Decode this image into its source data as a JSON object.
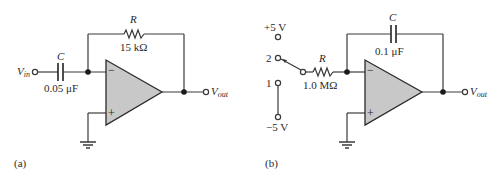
{
  "circuits": [
    {
      "id": "a",
      "caption": "(a)",
      "input_label": "V",
      "input_sub": "in",
      "output_label": "V",
      "output_sub": "out",
      "capacitor": {
        "name": "C",
        "value": "0.05 μF"
      },
      "resistor": {
        "name": "R",
        "value": "15 kΩ"
      },
      "opamp": {
        "inverting": "−",
        "noninverting": "+"
      }
    },
    {
      "id": "b",
      "caption": "(b)",
      "output_label": "V",
      "output_sub": "out",
      "switch": {
        "pos2_label": "2",
        "pos1_label": "1",
        "top_supply": "+5 V",
        "bottom_supply": "−5 V"
      },
      "resistor": {
        "name": "R",
        "value": "1.0 MΩ"
      },
      "capacitor": {
        "name": "C",
        "value": "0.1 μF"
      },
      "opamp": {
        "inverting": "−",
        "noninverting": "+"
      }
    }
  ],
  "colors": {
    "wire": "#3a3a3a",
    "opamp_fill": "#c8c8c8",
    "text": "#2a2a2a"
  }
}
